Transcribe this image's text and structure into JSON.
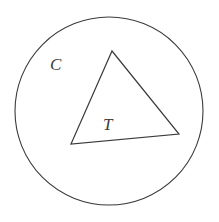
{
  "figure": {
    "background_color": "#ffffff",
    "stroke_color": "#3a3a3a",
    "label_color": "#3c3c3c",
    "stroke_width": 1.1,
    "width": 219,
    "height": 222,
    "circle": {
      "name": "C",
      "cx": 109,
      "cy": 111,
      "r": 94
    },
    "triangle": {
      "name": "T",
      "points": "112,51 179,134 71,144",
      "vertices": [
        {
          "label": "apex",
          "x": 112,
          "y": 51
        },
        {
          "label": "bottom-right",
          "x": 179,
          "y": 134
        },
        {
          "label": "bottom-left",
          "x": 71,
          "y": 144
        }
      ]
    },
    "labels": [
      {
        "id": "circle_label",
        "text": "C",
        "x": 50,
        "y": 70,
        "font_size": 17
      },
      {
        "id": "triangle_label",
        "text": "T",
        "x": 103,
        "y": 130,
        "font_size": 17
      }
    ]
  }
}
